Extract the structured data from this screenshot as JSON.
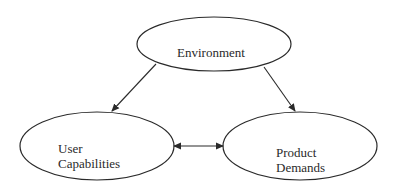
{
  "diagram": {
    "nodes": [
      {
        "id": "environment",
        "label_lines": [
          "Environment"
        ]
      },
      {
        "id": "user-capabilities",
        "label_lines": [
          "User",
          "Capabilities"
        ]
      },
      {
        "id": "product-demands",
        "label_lines": [
          "Product",
          "Demands"
        ]
      }
    ],
    "edges": [
      {
        "from": "environment",
        "to": "user-capabilities",
        "direction": "forward"
      },
      {
        "from": "environment",
        "to": "product-demands",
        "direction": "forward"
      },
      {
        "from": "user-capabilities",
        "to": "product-demands",
        "direction": "both"
      }
    ],
    "colors": {
      "stroke": "#2a2a2a",
      "background": "#ffffff"
    }
  }
}
